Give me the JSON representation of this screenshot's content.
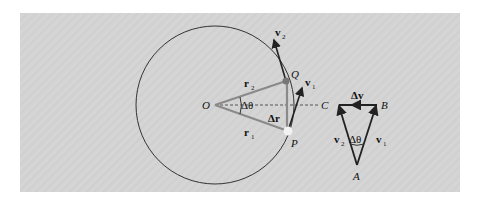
{
  "figure": {
    "background": "#d3d3d3",
    "points": {
      "O": "O",
      "P": "P",
      "Q": "Q",
      "A": "A",
      "B": "B",
      "C": "C"
    },
    "labels": {
      "r1": "r",
      "r1_sub": "1",
      "r2": "r",
      "r2_sub": "2",
      "v1": "v",
      "v1_sub": "1",
      "v2": "v",
      "v2_sub": "2",
      "delta_r": "Δr",
      "delta_theta": "Δθ",
      "delta_v": "Δv",
      "tri_v1": "v",
      "tri_v1_sub": "1",
      "tri_v2": "v",
      "tri_v2_sub": "2",
      "tri_delta_theta": "Δθ"
    },
    "arrow_mark": "→"
  }
}
